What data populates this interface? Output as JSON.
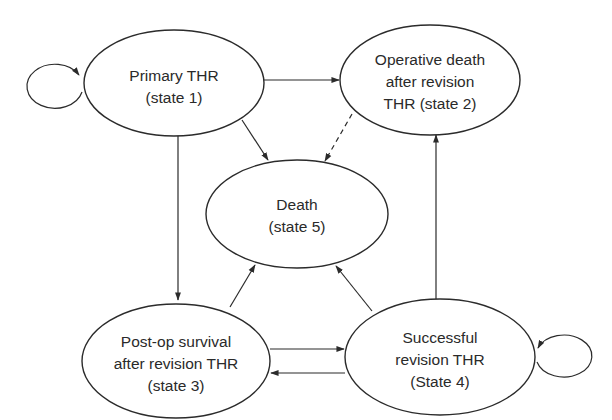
{
  "diagram": {
    "type": "state-transition (Markov model)",
    "colors": {
      "stroke": "#2b2b2b",
      "text": "#2a2a2a",
      "background": "#ffffff"
    },
    "nodes": [
      {
        "id": "state1",
        "lines": [
          "Primary THR",
          "(state 1)"
        ]
      },
      {
        "id": "state2",
        "lines": [
          "Operative death",
          "after revision",
          "THR (state 2)"
        ]
      },
      {
        "id": "state5",
        "lines": [
          "Death",
          "(state 5)"
        ]
      },
      {
        "id": "state3",
        "lines": [
          "Post-op survival",
          "after revision THR",
          "(state 3)"
        ]
      },
      {
        "id": "state4",
        "lines": [
          "Successful",
          "revision THR",
          "(State 4)"
        ]
      }
    ],
    "edges": [
      {
        "from": "state1",
        "to": "state1",
        "style": "solid",
        "kind": "self-loop"
      },
      {
        "from": "state1",
        "to": "state2",
        "style": "solid"
      },
      {
        "from": "state1",
        "to": "state5",
        "style": "solid"
      },
      {
        "from": "state1",
        "to": "state3",
        "style": "solid"
      },
      {
        "from": "state2",
        "to": "state5",
        "style": "dashed"
      },
      {
        "from": "state3",
        "to": "state5",
        "style": "solid"
      },
      {
        "from": "state3",
        "to": "state4",
        "style": "solid"
      },
      {
        "from": "state4",
        "to": "state3",
        "style": "solid"
      },
      {
        "from": "state4",
        "to": "state5",
        "style": "solid"
      },
      {
        "from": "state4",
        "to": "state2",
        "style": "solid"
      },
      {
        "from": "state4",
        "to": "state4",
        "style": "solid",
        "kind": "self-loop"
      }
    ]
  }
}
